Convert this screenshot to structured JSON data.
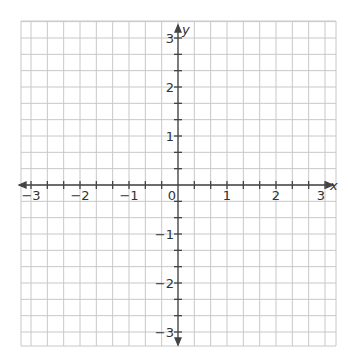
{
  "diagram": {
    "type": "coordinate-plane",
    "x_axis": {
      "label": "x",
      "min": -3,
      "max": 3,
      "tick_labels": [
        "−3",
        "−2",
        "−1",
        "0",
        "1",
        "2",
        "3"
      ]
    },
    "y_axis": {
      "label": "y",
      "min": -3,
      "max": 3,
      "tick_labels": [
        "3",
        "2",
        "1",
        "−1",
        "−2",
        "−3"
      ]
    },
    "grid": {
      "subdivisions_per_unit": 3,
      "show": true
    },
    "colors": {
      "grid": "#c8c8c8",
      "axis": "#444444",
      "text": "#333333"
    },
    "origin_label": "0"
  }
}
